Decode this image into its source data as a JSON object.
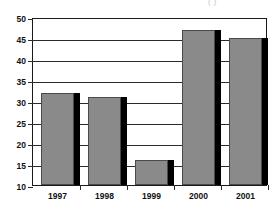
{
  "chart_data": {
    "type": "bar",
    "title": "(  )",
    "xlabel": "",
    "ylabel": "",
    "categories": [
      "1997",
      "1998",
      "1999",
      "2000",
      "2001"
    ],
    "values": [
      32,
      31,
      16,
      47,
      45
    ],
    "series": [
      {
        "name": "",
        "values": [
          32,
          31,
          16,
          47,
          45
        ]
      }
    ],
    "ylim": [
      10,
      50
    ],
    "ytick_step": 5,
    "ytick_labels": [
      "50",
      "45",
      "40",
      "35",
      "30",
      "25",
      "20",
      "15",
      "10"
    ],
    "ytick_values": [
      50,
      45,
      40,
      35,
      30,
      25,
      20,
      15,
      10
    ],
    "grid": true,
    "grid_axis": "y",
    "legend": false,
    "legend_position": "none",
    "bar_color": "#8a8a8a",
    "bar_edge_color": "#4a4a4a",
    "bar_shadow_color": "#000000",
    "axis_color": "#1a1a1a",
    "background_color": "#ffffff"
  }
}
